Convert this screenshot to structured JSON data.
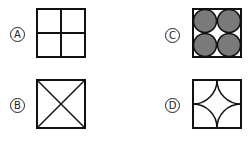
{
  "options": [
    {
      "id": "A",
      "label": "A",
      "shape": "square divided into four equal squares"
    },
    {
      "id": "B",
      "label": "B",
      "shape": "square with both diagonals"
    },
    {
      "id": "C",
      "label": "C",
      "shape": "square containing four gray circles",
      "fill_color": "#7a7a7a"
    },
    {
      "id": "D",
      "label": "D",
      "shape": "square with four inward quarter-circle arcs from corners"
    }
  ]
}
